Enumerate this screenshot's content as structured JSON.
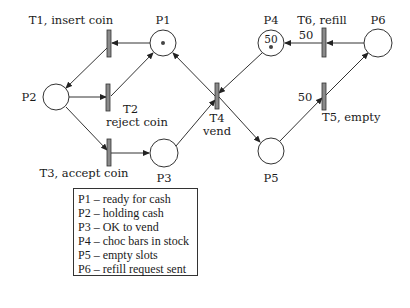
{
  "places": {
    "p1": {
      "label": "P1",
      "tokens": 1
    },
    "p2": {
      "label": "P2"
    },
    "p3": {
      "label": "P3"
    },
    "p4": {
      "label": "P4",
      "capacity_label": "50",
      "tokens": 1
    },
    "p5": {
      "label": "P5"
    },
    "p6": {
      "label": "P6"
    }
  },
  "transitions": {
    "t1": {
      "label": "T1, insert coin"
    },
    "t2": {
      "label": "T2",
      "sublabel": "reject coin"
    },
    "t3": {
      "label": "T3, accept coin"
    },
    "t4": {
      "label": "T4",
      "sublabel": "vend"
    },
    "t5": {
      "label": "T5, empty",
      "weight": "50"
    },
    "t6": {
      "label": "T6, refill",
      "weight": "50"
    }
  },
  "legend": {
    "items": [
      "P1 – ready for cash",
      "P2 – holding cash",
      "P3 – OK to vend",
      "P4 – choc bars in stock",
      "P5 – empty slots",
      "P6 – refill request sent"
    ]
  }
}
